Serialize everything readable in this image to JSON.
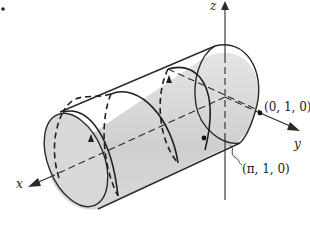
{
  "figure": {
    "marker": "•",
    "axes": {
      "x_label": "x",
      "y_label": "y",
      "z_label": "z"
    },
    "points": [
      {
        "label": "(0, 1, 0)"
      },
      {
        "label": "(π, 1, 0)"
      }
    ],
    "colors": {
      "cylinder_fill": "#d6d6d6",
      "stroke": "#2a2a2a",
      "background": "#ffffff"
    }
  }
}
